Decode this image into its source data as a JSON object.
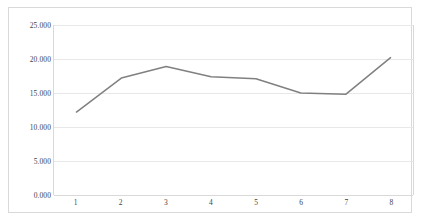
{
  "chart_data": {
    "type": "line",
    "title": "",
    "subtitle": "",
    "xlabel": "",
    "ylabel": "",
    "categories": [
      "1",
      "2",
      "3",
      "4",
      "5",
      "6",
      "7",
      "8"
    ],
    "values": [
      12.2,
      17.2,
      18.9,
      17.4,
      17.1,
      15.0,
      14.8,
      20.2
    ],
    "series": [
      {
        "name": "",
        "values": [
          12.2,
          17.2,
          18.9,
          17.4,
          17.1,
          15.0,
          14.8,
          20.2
        ]
      }
    ],
    "y_tick_labels": [
      "0.000",
      "5.000",
      "10.000",
      "15.000",
      "20.000",
      "25.000"
    ],
    "y_tick_values": [
      0,
      5,
      10,
      15,
      20,
      25
    ],
    "x_tick_labels": [
      "1",
      "2",
      "3",
      "4",
      "5",
      "6",
      "7",
      "8"
    ],
    "ylim": [
      0,
      25
    ],
    "grid": "horizontal",
    "legend": "none",
    "markers": false,
    "line_color": "#808080",
    "grid_color": "#e8e8e8",
    "axis_color": "#d9d9d9",
    "background_color": "#ffffff",
    "text_color": "#3f3f3f"
  }
}
